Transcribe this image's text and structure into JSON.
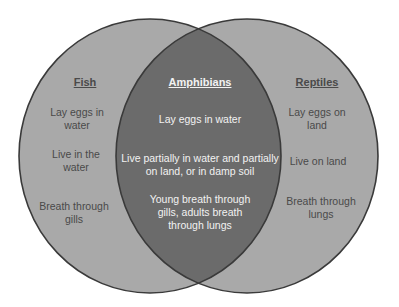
{
  "diagram": {
    "type": "venn",
    "colors": {
      "outer_fill": "#a9a9a9",
      "overlap_fill": "#6b6b6b",
      "stroke": "#3a3a3a",
      "outer_text": "#4a4a4a",
      "overlap_text": "#f2f2f2"
    },
    "left": {
      "title": "Fish",
      "items": [
        "Lay eggs in water",
        "Live in the water",
        "Breath through gills"
      ]
    },
    "center": {
      "title": "Amphibians",
      "items": [
        "Lay eggs in water",
        "Live partially in water and partially on land, or in damp soil",
        "Young breath through gills, adults breath through lungs"
      ]
    },
    "right": {
      "title": "Reptiles",
      "items": [
        "Lay eggs on land",
        "Live on land",
        "Breath through lungs"
      ]
    }
  }
}
